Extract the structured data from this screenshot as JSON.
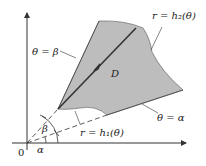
{
  "diagram": {
    "type": "polar-region",
    "labels": {
      "origin": "0",
      "region": "D",
      "theta_beta": "θ = β",
      "theta_alpha": "θ = α",
      "outer_curve": "r = h₂(θ)",
      "inner_curve": "r = h₁(θ)",
      "angle_beta": "β",
      "angle_alpha": "α"
    },
    "colors": {
      "region_fill": "#bdbdbd",
      "line": "#333333",
      "background": "#ffffff"
    }
  }
}
